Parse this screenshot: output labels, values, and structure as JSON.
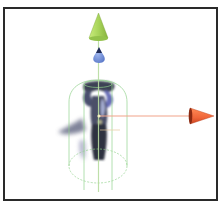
{
  "viewport": {
    "name": "Scene View",
    "background": "#ffffff",
    "border_color": "#2a2a2a"
  },
  "gizmo": {
    "type": "translate",
    "axes": [
      {
        "axis": "y",
        "color": "#a8d45a",
        "icon": "green-cone-arrow"
      },
      {
        "axis": "x",
        "color": "#f0663a",
        "icon": "red-cone-arrow"
      },
      {
        "axis": "z",
        "color": "#6f8fd8",
        "icon": "blue-cone-arrow"
      }
    ]
  },
  "selected_object": {
    "type": "character-model",
    "collider": "capsule",
    "collider_color": "#8fd08a",
    "shadow_color": "#4a4f6e"
  }
}
